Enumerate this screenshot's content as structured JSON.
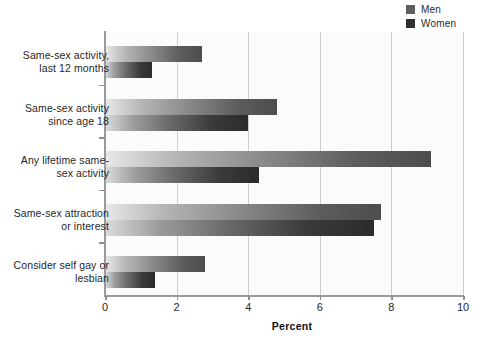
{
  "chart_data": {
    "type": "bar",
    "orientation": "horizontal",
    "title": "",
    "xlabel": "Percent",
    "ylabel": "",
    "xlim": [
      0,
      10
    ],
    "xticks": [
      0,
      2,
      4,
      6,
      8,
      10
    ],
    "xtick_labels": [
      "0",
      "2",
      "4",
      "6",
      "8",
      "10"
    ],
    "grid": "vertical",
    "legend_position": "top-right",
    "categories": [
      "Same-sex activity, last 12 months",
      "Same-sex activity since age 18",
      "Any lifetime same-sex activity",
      "Same-sex attraction or interest",
      "Consider self gay or lesbian"
    ],
    "category_lines": [
      [
        "Same-sex activity,",
        "last 12 months"
      ],
      [
        "Same-sex activity",
        "since age 18"
      ],
      [
        "Any lifetime same-",
        "sex activity"
      ],
      [
        "Same-sex attraction",
        "or interest"
      ],
      [
        "Consider self gay or",
        "lesbian"
      ]
    ],
    "series": [
      {
        "name": "Men",
        "color": "#5e5e5e",
        "values": [
          2.7,
          4.8,
          9.1,
          7.7,
          2.8
        ]
      },
      {
        "name": "Women",
        "color": "#313131",
        "values": [
          1.3,
          4.0,
          4.3,
          7.5,
          1.4
        ]
      }
    ]
  },
  "legend": {
    "items": [
      {
        "label": "Men"
      },
      {
        "label": "Women"
      }
    ]
  },
  "axis": {
    "x_title": "Percent"
  }
}
